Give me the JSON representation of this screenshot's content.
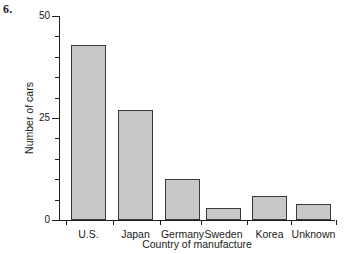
{
  "figure": {
    "problem_number": "6.",
    "background_color": "#ffffff"
  },
  "chart_data": {
    "type": "bar",
    "title": "",
    "xlabel": "Country of manufacture",
    "ylabel": "Number of cars",
    "categories": [
      "U.S.",
      "Japan",
      "Germany",
      "Sweden",
      "Korea",
      "Unknown"
    ],
    "values": [
      43,
      27,
      10,
      3,
      6,
      4
    ],
    "ylim": [
      0,
      50
    ],
    "y_tick_labels": [
      "0",
      "25",
      "50"
    ],
    "y_major_ticks": [
      0,
      25,
      50
    ],
    "y_minor_ticks": [
      5,
      10,
      15,
      20,
      30,
      35,
      40,
      45
    ],
    "grid": false,
    "legend": null,
    "bar_fill_color": "#c8c8c8",
    "bar_edge_color": "#3a3a3a",
    "axis_color": "#1d1d1d"
  }
}
